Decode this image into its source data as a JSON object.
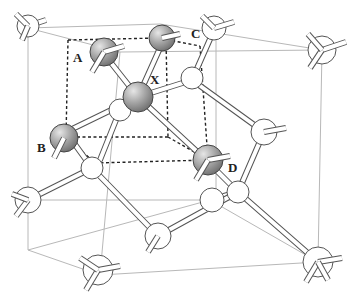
{
  "figure": {
    "labels": {
      "A": "A",
      "B": "B",
      "C": "C",
      "D": "D",
      "X": "X"
    },
    "colors": {
      "highlighted_atom": "#9a9a9a",
      "lattice_atom": "#ffffff",
      "cube_edge": "#b8b8b8",
      "tetrahedron_cube": "#222222"
    }
  }
}
